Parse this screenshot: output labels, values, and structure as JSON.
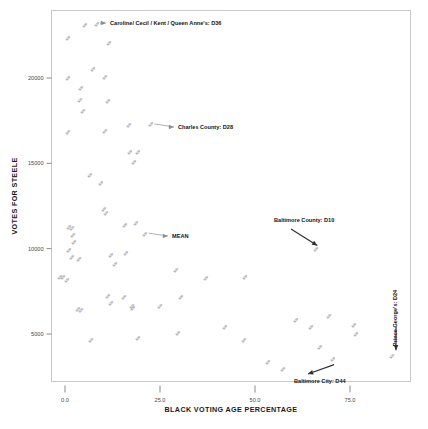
{
  "chart_data": {
    "type": "scatter",
    "title": "",
    "xlabel": "BLACK VOTING AGE PERCENTAGE",
    "ylabel": "VOTES FOR STEELE",
    "xlim": [
      -3.5,
      91.0
    ],
    "ylim": [
      1700,
      23600
    ],
    "xticks": [
      0.0,
      25.0,
      50.0,
      75.0
    ],
    "xtick_labels": [
      "0.0",
      "25.0",
      "50.0",
      "75.0"
    ],
    "yticks": [
      5000,
      10000,
      15000,
      20000
    ],
    "ytick_labels": [
      "5000",
      "10000",
      "15000",
      "20000"
    ],
    "grid": false,
    "legend": "none",
    "marker_glyph": "✐",
    "marker_color": "#8d8d93",
    "points": [
      {
        "x": 5.2,
        "y": 23050
      },
      {
        "x": 8.3,
        "y": 23150
      },
      {
        "x": 0.9,
        "y": 22300
      },
      {
        "x": 11.6,
        "y": 22000
      },
      {
        "x": 7.4,
        "y": 20500
      },
      {
        "x": 0.8,
        "y": 19950
      },
      {
        "x": 10.6,
        "y": 20050
      },
      {
        "x": 4.3,
        "y": 19400
      },
      {
        "x": 3.9,
        "y": 18650
      },
      {
        "x": 11.4,
        "y": 18600
      },
      {
        "x": 4.8,
        "y": 18050
      },
      {
        "x": 0.7,
        "y": 16800
      },
      {
        "x": 10.6,
        "y": 16850
      },
      {
        "x": 16.9,
        "y": 17200
      },
      {
        "x": 22.6,
        "y": 17250
      },
      {
        "x": 17.0,
        "y": 15650
      },
      {
        "x": 19.3,
        "y": 15650
      },
      {
        "x": 18.2,
        "y": 15050
      },
      {
        "x": 6.5,
        "y": 14300
      },
      {
        "x": 9.5,
        "y": 13800
      },
      {
        "x": 10.2,
        "y": 12300
      },
      {
        "x": 10.8,
        "y": 12050
      },
      {
        "x": 15.7,
        "y": 11350
      },
      {
        "x": 18.6,
        "y": 11450
      },
      {
        "x": 1.1,
        "y": 11250
      },
      {
        "x": 1.9,
        "y": 11150
      },
      {
        "x": 2.0,
        "y": 10750
      },
      {
        "x": 2.3,
        "y": 10350
      },
      {
        "x": 21.1,
        "y": 10850
      },
      {
        "x": 1.0,
        "y": 9900
      },
      {
        "x": 1.8,
        "y": 9450
      },
      {
        "x": 3.6,
        "y": 9350
      },
      {
        "x": 12.1,
        "y": 9600
      },
      {
        "x": 13.1,
        "y": 9050
      },
      {
        "x": 16.1,
        "y": 9700
      },
      {
        "x": 66.0,
        "y": 9950
      },
      {
        "x": -1.2,
        "y": 8300
      },
      {
        "x": -0.4,
        "y": 8300
      },
      {
        "x": 0.6,
        "y": 8100
      },
      {
        "x": 29.1,
        "y": 8700
      },
      {
        "x": 37.0,
        "y": 8250
      },
      {
        "x": 47.4,
        "y": 8300
      },
      {
        "x": 11.2,
        "y": 7200
      },
      {
        "x": 15.4,
        "y": 7150
      },
      {
        "x": 30.4,
        "y": 7150
      },
      {
        "x": 12.0,
        "y": 6800
      },
      {
        "x": 17.6,
        "y": 6600
      },
      {
        "x": 18.0,
        "y": 6500
      },
      {
        "x": 25.1,
        "y": 6600
      },
      {
        "x": 3.5,
        "y": 6450
      },
      {
        "x": 4.1,
        "y": 6350
      },
      {
        "x": 60.8,
        "y": 5800
      },
      {
        "x": 69.6,
        "y": 6000
      },
      {
        "x": 64.8,
        "y": 5350
      },
      {
        "x": 76.0,
        "y": 5500
      },
      {
        "x": 42.0,
        "y": 5400
      },
      {
        "x": 29.8,
        "y": 5000
      },
      {
        "x": 76.6,
        "y": 4950
      },
      {
        "x": 19.2,
        "y": 4750
      },
      {
        "x": 6.8,
        "y": 4600
      },
      {
        "x": 47.2,
        "y": 4600
      },
      {
        "x": 67.0,
        "y": 4200
      },
      {
        "x": 86.0,
        "y": 3700
      },
      {
        "x": 53.4,
        "y": 3300
      },
      {
        "x": 70.4,
        "y": 3500
      },
      {
        "x": 57.4,
        "y": 2900
      }
    ],
    "annotations": [
      {
        "id": "caroline-cecil-kent-queen-annes",
        "label": "Caroline/ Cecil / Kent / Queen Anne's: D36",
        "style": "leader-right",
        "target": {
          "x": 8.3,
          "y": 23150
        },
        "text_pos": {
          "x": 110,
          "y": 25
        }
      },
      {
        "id": "charles-county",
        "label": "Charles County: D28",
        "style": "leader-right",
        "target": {
          "x": 22.6,
          "y": 17250
        },
        "text_pos": {
          "x": 178,
          "y": 129
        }
      },
      {
        "id": "mean",
        "label": "MEAN",
        "style": "leader-right",
        "target": {
          "x": 21.1,
          "y": 10850
        },
        "text_pos": {
          "x": 172,
          "y": 238
        }
      },
      {
        "id": "baltimore-county",
        "label": "Baltimore County: D10",
        "style": "arrow-down-left",
        "target": {
          "x": 66.0,
          "y": 9950
        },
        "text_pos": {
          "x": 274,
          "y": 222
        }
      },
      {
        "id": "baltimore-city",
        "label": "Baltimore City: D44",
        "style": "arrow-up-right",
        "target": {
          "x": 70.4,
          "y": 3500
        },
        "text_pos": {
          "x": 294,
          "y": 383
        }
      },
      {
        "id": "prince-georges",
        "label": "Prince George's: D24",
        "style": "rotated-arrow-down",
        "target": {
          "x": 86.0,
          "y": 3700
        },
        "text_pos": {
          "x": 397,
          "y": 318
        }
      }
    ]
  }
}
